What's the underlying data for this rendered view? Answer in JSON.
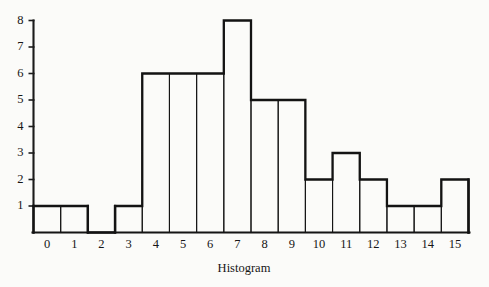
{
  "chart_data": {
    "type": "bar",
    "title": "",
    "xlabel": "Histogram",
    "ylabel": "",
    "categories": [
      "0",
      "1",
      "2",
      "3",
      "4",
      "5",
      "6",
      "7",
      "8",
      "9",
      "10",
      "11",
      "12",
      "13",
      "14",
      "15"
    ],
    "values": [
      1,
      1,
      0,
      1,
      6,
      6,
      6,
      8,
      5,
      5,
      2,
      3,
      2,
      1,
      1,
      2
    ],
    "ylim": [
      0,
      8
    ],
    "xlim": [
      -0.5,
      15.5
    ],
    "ytick_labels": [
      "1",
      "2",
      "3",
      "4",
      "5",
      "6",
      "7",
      "8"
    ],
    "ytick_values": [
      1,
      2,
      3,
      4,
      5,
      6,
      7,
      8
    ],
    "xtick_labels": [
      "0",
      "1",
      "2",
      "3",
      "4",
      "5",
      "6",
      "7",
      "8",
      "9",
      "10",
      "11",
      "12",
      "13",
      "14",
      "15"
    ],
    "grid": false,
    "legend": null,
    "bar_style": "outlined-adjacent",
    "colors": {
      "axis": "#1b1b1b",
      "bar_stroke": "#131313",
      "background": "#fbfbf9",
      "text": "#161616"
    }
  },
  "figure": {
    "caption": "Histogram",
    "axis_title_bottom": "Histogram"
  }
}
